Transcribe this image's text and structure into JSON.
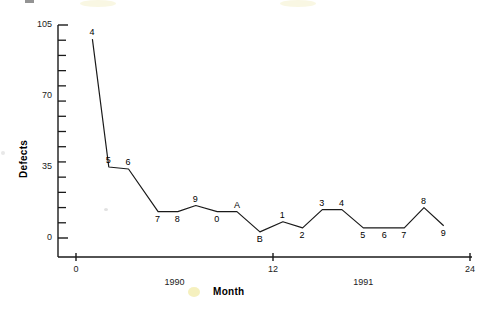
{
  "chart_data": {
    "type": "line",
    "title": "",
    "xlabel": "Month",
    "ylabel": "Defects",
    "xlim": [
      0,
      24
    ],
    "ylim": [
      0,
      105
    ],
    "grid": false,
    "legend": "none",
    "y_ticks_major": [
      0,
      35,
      70,
      105
    ],
    "y_tick_labels": [
      "0",
      "35",
      "70",
      "105"
    ],
    "y_minor_tick_count": 14,
    "x_ticks": [
      0,
      12,
      24
    ],
    "x_tick_labels": [
      "0",
      "12",
      "24"
    ],
    "x_group_labels": [
      {
        "label": "1990",
        "x": 6
      },
      {
        "label": "1991",
        "x": 17.5
      }
    ],
    "point_labels": [
      "4",
      "5",
      "6",
      "7",
      "8",
      "9",
      "0",
      "A",
      "B",
      "1",
      "2",
      "3",
      "4",
      "5",
      "6",
      "7",
      "8",
      "9"
    ],
    "x": [
      1.0,
      2.0,
      3.2,
      5.0,
      6.2,
      7.3,
      8.6,
      9.8,
      11.2,
      12.6,
      13.8,
      15.0,
      16.2,
      17.5,
      18.8,
      20.0,
      21.2,
      22.4
    ],
    "values": [
      98,
      35,
      34,
      13,
      13,
      16,
      13,
      13,
      3,
      8,
      5,
      14,
      14,
      5,
      5,
      5,
      15,
      6
    ],
    "series": [
      {
        "name": "Defects",
        "values": [
          98,
          35,
          34,
          13,
          13,
          16,
          13,
          13,
          3,
          8,
          5,
          14,
          14,
          5,
          5,
          5,
          15,
          6
        ]
      }
    ],
    "colors": {
      "line": "#1a1a1a",
      "axis": "#1a1a1a",
      "text": "#222222",
      "background": "#ffffff"
    }
  }
}
